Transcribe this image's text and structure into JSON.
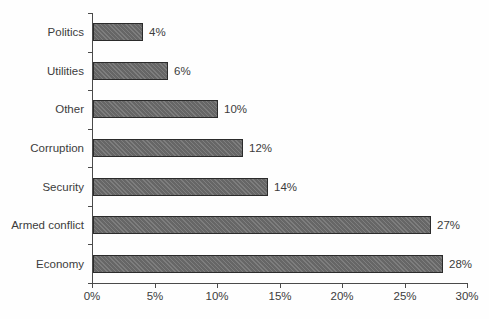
{
  "chart_data": {
    "type": "bar",
    "orientation": "horizontal",
    "title": "",
    "xlabel": "",
    "ylabel": "",
    "categories": [
      "Politics",
      "Utilities",
      "Other",
      "Corruption",
      "Security",
      "Armed conflict",
      "Economy"
    ],
    "values": [
      4,
      6,
      10,
      12,
      14,
      27,
      28
    ],
    "value_labels": [
      "4%",
      "6%",
      "10%",
      "12%",
      "14%",
      "27%",
      "28%"
    ],
    "xlim": [
      0,
      30
    ],
    "x_ticks": [
      0,
      5,
      10,
      15,
      20,
      25,
      30
    ],
    "x_tick_labels": [
      "0%",
      "5%",
      "10%",
      "15%",
      "20%",
      "25%",
      "30%"
    ],
    "grid": false,
    "legend": null,
    "data_labels": true,
    "bar_color": "#6f6f6f",
    "bar_border_color": "#2b2b2b",
    "axis_color": "#4a4a4a",
    "text_color": "#3c3c3c",
    "background_color": "#fefefe"
  }
}
